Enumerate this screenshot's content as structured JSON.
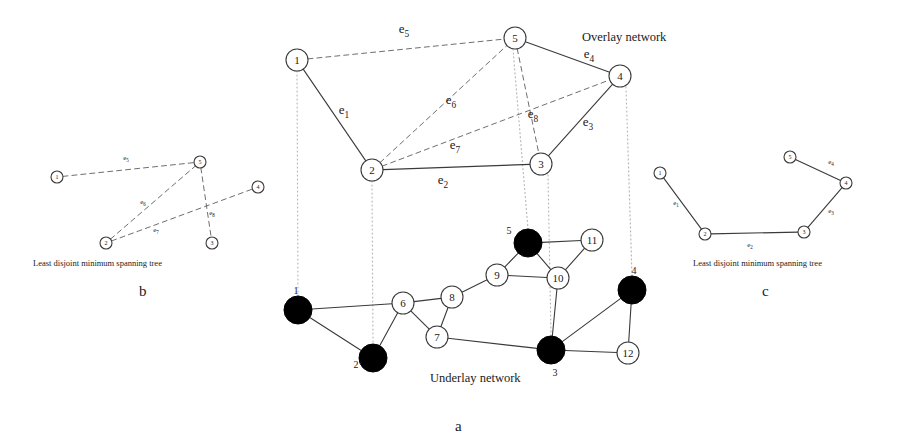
{
  "figure": {
    "panels": [
      {
        "id": "a",
        "label": "a",
        "label_pos": {
          "x": 455,
          "y": 418
        }
      },
      {
        "id": "b",
        "label": "b",
        "label_pos": {
          "x": 139,
          "y": 283
        }
      },
      {
        "id": "c",
        "label": "c",
        "label_pos": {
          "x": 762,
          "y": 283
        }
      }
    ],
    "captions": [
      {
        "name": "overlay-network-caption",
        "text": "Overlay network",
        "x": 582,
        "y": 30,
        "cls": "cap-net"
      },
      {
        "name": "underlay-network-caption",
        "text": "Underlay network",
        "x": 430,
        "y": 371,
        "cls": "cap-net"
      },
      {
        "name": "mst-caption-b",
        "text": "Least disjoint minimum spanning tree",
        "x": 33,
        "y": 258,
        "cls": "cap-mst-small"
      },
      {
        "name": "mst-caption-c",
        "text": "Least disjoint minimum spanning tree",
        "x": 693,
        "y": 258,
        "cls": "cap-mst-small"
      }
    ]
  },
  "overlay": {
    "name": "Overlay network",
    "node_radius": 11,
    "nodes": [
      {
        "id": "1",
        "label": "1",
        "x": 297,
        "y": 60
      },
      {
        "id": "2",
        "label": "2",
        "x": 372,
        "y": 170
      },
      {
        "id": "3",
        "label": "3",
        "x": 541,
        "y": 164
      },
      {
        "id": "4",
        "label": "4",
        "x": 620,
        "y": 76
      },
      {
        "id": "5",
        "label": "5",
        "x": 515,
        "y": 38
      }
    ],
    "solid_edges": [
      {
        "id": "e1",
        "from": "1",
        "to": "2",
        "label": "e",
        "sub": "1",
        "lx": 344,
        "ly": 114
      },
      {
        "id": "e2",
        "from": "2",
        "to": "3",
        "label": "e",
        "sub": "2",
        "lx": 443,
        "ly": 184
      },
      {
        "id": "e3",
        "from": "3",
        "to": "4",
        "label": "e",
        "sub": "3",
        "lx": 588,
        "ly": 126
      },
      {
        "id": "e4",
        "from": "5",
        "to": "4",
        "label": "e",
        "sub": "4",
        "lx": 589,
        "ly": 58
      }
    ],
    "dashed_edges": [
      {
        "id": "e5",
        "from": "1",
        "to": "5",
        "label": "e",
        "sub": "5",
        "lx": 404,
        "ly": 33
      },
      {
        "id": "e6",
        "from": "2",
        "to": "5",
        "label": "e",
        "sub": "6",
        "lx": 451,
        "ly": 104
      },
      {
        "id": "e7",
        "from": "2",
        "to": "4",
        "label": "e",
        "sub": "7",
        "lx": 455,
        "ly": 149
      },
      {
        "id": "e8",
        "from": "5",
        "to": "3",
        "label": "e",
        "sub": "8",
        "lx": 533,
        "ly": 118
      }
    ]
  },
  "underlay": {
    "name": "Underlay network",
    "node_radius_plain": 11,
    "node_radius_mapped": 14,
    "nodes": [
      {
        "id": "1",
        "label": "1",
        "x": 298,
        "y": 310,
        "mapped": true,
        "label_dx": -2,
        "label_dy": -20
      },
      {
        "id": "2",
        "label": "2",
        "x": 373,
        "y": 358,
        "mapped": true,
        "label_dx": -17,
        "label_dy": 6
      },
      {
        "id": "3",
        "label": "3",
        "x": 551,
        "y": 350,
        "mapped": true,
        "label_dx": 4,
        "label_dy": 22
      },
      {
        "id": "4",
        "label": "4",
        "x": 632,
        "y": 290,
        "mapped": true,
        "label_dx": 2,
        "label_dy": -20
      },
      {
        "id": "5",
        "label": "5",
        "x": 528,
        "y": 243,
        "mapped": true,
        "label_dx": -19,
        "label_dy": -13
      },
      {
        "id": "6",
        "label": "6",
        "x": 403,
        "y": 303,
        "mapped": false
      },
      {
        "id": "7",
        "label": "7",
        "x": 437,
        "y": 337,
        "mapped": false
      },
      {
        "id": "8",
        "label": "8",
        "x": 452,
        "y": 297,
        "mapped": false
      },
      {
        "id": "9",
        "label": "9",
        "x": 497,
        "y": 275,
        "mapped": false
      },
      {
        "id": "10",
        "label": "10",
        "x": 558,
        "y": 278,
        "mapped": false
      },
      {
        "id": "11",
        "label": "11",
        "x": 592,
        "y": 240,
        "mapped": false
      },
      {
        "id": "12",
        "label": "12",
        "x": 628,
        "y": 353,
        "mapped": false
      }
    ],
    "edges": [
      {
        "from": "1",
        "to": "6"
      },
      {
        "from": "1",
        "to": "2"
      },
      {
        "from": "2",
        "to": "6"
      },
      {
        "from": "6",
        "to": "8"
      },
      {
        "from": "6",
        "to": "7"
      },
      {
        "from": "7",
        "to": "8"
      },
      {
        "from": "8",
        "to": "9"
      },
      {
        "from": "9",
        "to": "5"
      },
      {
        "from": "9",
        "to": "10"
      },
      {
        "from": "5",
        "to": "11"
      },
      {
        "from": "5",
        "to": "10"
      },
      {
        "from": "10",
        "to": "11"
      },
      {
        "from": "10",
        "to": "3"
      },
      {
        "from": "7",
        "to": "3"
      },
      {
        "from": "3",
        "to": "4"
      },
      {
        "from": "3",
        "to": "12"
      },
      {
        "from": "4",
        "to": "12"
      }
    ]
  },
  "projections": [
    {
      "overlay": "1",
      "underlay": "1",
      "x1": 297,
      "y1": 71,
      "x2": 298,
      "y2": 296
    },
    {
      "overlay": "2",
      "underlay": "2",
      "x1": 372,
      "y1": 181,
      "x2": 373,
      "y2": 344
    },
    {
      "overlay": "3",
      "underlay": "3",
      "x1": 548,
      "y1": 175,
      "x2": 551,
      "y2": 336
    },
    {
      "overlay": "4",
      "underlay": "4",
      "x1": 626,
      "y1": 87,
      "x2": 632,
      "y2": 276
    },
    {
      "overlay": "5",
      "underlay": "5",
      "x1": 513,
      "y1": 49,
      "x2": 528,
      "y2": 229
    }
  ],
  "panel_b": {
    "caption": "Least disjoint minimum spanning tree",
    "label": "b",
    "node_radius": 6,
    "nodes": [
      {
        "id": "1",
        "label": "1",
        "x": 57,
        "y": 177
      },
      {
        "id": "2",
        "label": "2",
        "x": 106,
        "y": 243
      },
      {
        "id": "3",
        "label": "3",
        "x": 212,
        "y": 243
      },
      {
        "id": "4",
        "label": "4",
        "x": 258,
        "y": 187
      },
      {
        "id": "5",
        "label": "5",
        "x": 200,
        "y": 162
      }
    ],
    "dashed_edges": [
      {
        "id": "e5",
        "from": "1",
        "to": "5",
        "label": "e",
        "sub": "5",
        "lx": 126,
        "ly": 160
      },
      {
        "id": "e6",
        "from": "2",
        "to": "5",
        "label": "e",
        "sub": "6",
        "lx": 143,
        "ly": 204
      },
      {
        "id": "e7",
        "from": "2",
        "to": "4",
        "label": "e",
        "sub": "7",
        "lx": 156,
        "ly": 232
      },
      {
        "id": "e8",
        "from": "5",
        "to": "3",
        "label": "e",
        "sub": "8",
        "lx": 212,
        "ly": 215
      }
    ]
  },
  "panel_c": {
    "caption": "Least disjoint minimum spanning tree",
    "label": "c",
    "node_radius": 6,
    "nodes": [
      {
        "id": "1",
        "label": "1",
        "x": 660,
        "y": 173
      },
      {
        "id": "2",
        "label": "2",
        "x": 705,
        "y": 234
      },
      {
        "id": "3",
        "label": "3",
        "x": 804,
        "y": 232
      },
      {
        "id": "4",
        "label": "4",
        "x": 846,
        "y": 183
      },
      {
        "id": "5",
        "label": "5",
        "x": 790,
        "y": 157
      }
    ],
    "solid_edges": [
      {
        "id": "e1",
        "from": "1",
        "to": "2",
        "label": "e",
        "sub": "1",
        "lx": 676,
        "ly": 205
      },
      {
        "id": "e2",
        "from": "2",
        "to": "3",
        "label": "e",
        "sub": "2",
        "lx": 750,
        "ly": 247
      },
      {
        "id": "e3",
        "from": "3",
        "to": "4",
        "label": "e",
        "sub": "3",
        "lx": 831,
        "ly": 213
      },
      {
        "id": "e4",
        "from": "5",
        "to": "4",
        "label": "e",
        "sub": "4",
        "lx": 831,
        "ly": 164
      }
    ]
  },
  "colors": {
    "stroke": "#3a3a3a",
    "dashed": "#6e6e6e",
    "projection": "#b9b9b9",
    "node_fill": "#ffffff",
    "mapped_fill": "#000000",
    "text": "#1a1a1a"
  }
}
